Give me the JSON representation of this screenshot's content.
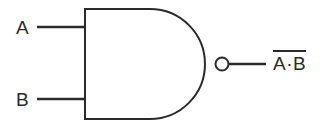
{
  "diagram": {
    "type": "logic-gate",
    "gate": "NAND",
    "inputs": [
      {
        "id": "a",
        "label": "A"
      },
      {
        "id": "b",
        "label": "B"
      }
    ],
    "output": {
      "id": "y",
      "label": "A·B",
      "overbar": true,
      "expression": "NOT (A AND B)"
    },
    "style": {
      "line_color": "#2b2b2b",
      "background": "#ffffff",
      "fill": "#ffffff",
      "stroke_width": 2
    },
    "geometry": {
      "body_left_x": 85,
      "body_top_y": 9,
      "body_bottom_y": 119,
      "body_arc_right_x": 215,
      "bubble_center_x": 222,
      "bubble_center_y": 64,
      "bubble_radius": 6.5,
      "input_a_y": 27,
      "input_b_y": 99,
      "input_line_start_x": 37,
      "output_line_end_x": 266
    }
  }
}
